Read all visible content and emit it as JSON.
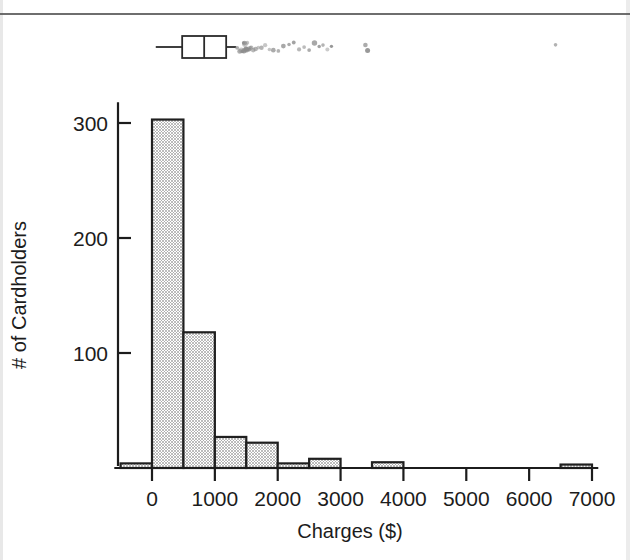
{
  "figure": {
    "kind": "histogram-with-boxplot",
    "page_rule": "horizontal-rule"
  },
  "axes": {
    "x_title": "Charges ($)",
    "y_title": "# of Cardholders",
    "x_ticks": [
      "0",
      "1000",
      "2000",
      "3000",
      "4000",
      "5000",
      "6000",
      "7000"
    ],
    "y_ticks": [
      "100",
      "200",
      "300"
    ]
  },
  "colors": {
    "bar_fill": "#bdbdbd",
    "bar_stroke": "#1f1f1f",
    "outlier": "#8c8c8c",
    "axis": "#1c1c1c",
    "background": "#ffffff"
  },
  "chart_data": [
    {
      "type": "bar",
      "title": "",
      "subtitle": "Histogram of credit card charges",
      "xlabel": "Charges ($)",
      "ylabel": "# of Cardholders",
      "xlim": [
        -500,
        7000
      ],
      "ylim": [
        0,
        320
      ],
      "grid": false,
      "legend": "none",
      "bin_width": 500,
      "categories": [
        "-500 to 0",
        "0 to 500",
        "500 to 1000",
        "1000 to 1500",
        "1500 to 2000",
        "2000 to 2500",
        "2500 to 3000",
        "3000 to 3500",
        "3500 to 4000",
        "4000 to 4500",
        "4500 to 5000",
        "5000 to 5500",
        "5500 to 6000",
        "6000 to 6500",
        "6500 to 7000"
      ],
      "bin_edges": [
        -500,
        0,
        500,
        1000,
        1500,
        2000,
        2500,
        3000,
        3500,
        4000,
        4500,
        5000,
        5500,
        6000,
        6500,
        7000
      ],
      "values": [
        4,
        303,
        118,
        27,
        22,
        4,
        8,
        0,
        5,
        0,
        0,
        0,
        0,
        0,
        3
      ],
      "x_tick_values": [
        0,
        1000,
        2000,
        3000,
        4000,
        5000,
        6000,
        7000
      ],
      "y_tick_values": [
        100,
        200,
        300
      ]
    },
    {
      "type": "boxplot",
      "title": "",
      "orientation": "horizontal",
      "xlabel": "Charges ($)",
      "xlim": [
        -500,
        7000
      ],
      "stats": {
        "whisker_low": 60,
        "q1": 480,
        "median": 830,
        "q3": 1180,
        "whisker_high": 1340
      },
      "outliers": [
        1355,
        1395,
        1420,
        1432,
        1448,
        1455,
        1462,
        1470,
        1478,
        1486,
        1495,
        1505,
        1515,
        1530,
        1548,
        1562,
        1580,
        1610,
        1648,
        1690,
        1742,
        1800,
        1868,
        1930,
        2010,
        2090,
        2180,
        2255,
        2340,
        2420,
        2500,
        2585,
        2660,
        2720,
        2790,
        2855,
        3395,
        3430,
        6420
      ]
    }
  ]
}
